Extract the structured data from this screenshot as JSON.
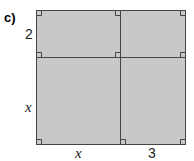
{
  "figure": {
    "part_label": "c)",
    "dimensions": {
      "top_left_height": "2",
      "bottom_left_height": "x",
      "bottom_left_width": "x",
      "bottom_right_width": "3"
    },
    "colors": {
      "fill": "#c8c8c8",
      "stroke": "#444444"
    },
    "regions": [
      {
        "name": "x-by-2",
        "width": "x",
        "height": "2"
      },
      {
        "name": "3-by-2",
        "width": "3",
        "height": "2"
      },
      {
        "name": "x-by-x",
        "width": "x",
        "height": "x"
      },
      {
        "name": "3-by-x",
        "width": "3",
        "height": "x"
      }
    ]
  }
}
